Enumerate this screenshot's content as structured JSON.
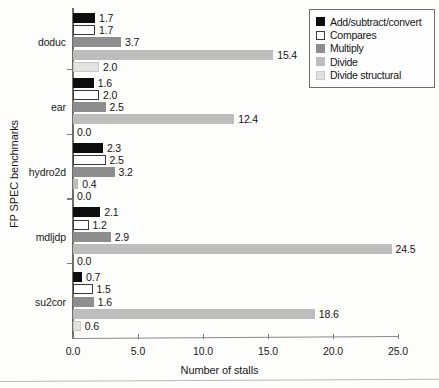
{
  "chart_data": {
    "type": "bar",
    "orientation": "horizontal",
    "title": "",
    "xlabel": "Number of stalls",
    "ylabel": "FP SPEC benchmarks",
    "xlim": [
      0.0,
      25.0
    ],
    "xticks": [
      "0.0",
      "5.0",
      "10.0",
      "15.0",
      "20.0",
      "25.0"
    ],
    "xtick_values": [
      0.0,
      5.0,
      10.0,
      15.0,
      20.0,
      25.0
    ],
    "grid": false,
    "legend_position": "top-right",
    "categories": [
      "doduc",
      "ear",
      "hydro2d",
      "mdljdp",
      "su2cor"
    ],
    "series": [
      {
        "name": "Add/subtract/convert",
        "color": "#0d0d0d",
        "border": "#0d0d0d",
        "values": [
          1.7,
          1.6,
          2.3,
          2.1,
          0.7
        ],
        "labels": [
          "1.7",
          "1.6",
          "2.3",
          "2.1",
          "0.7"
        ]
      },
      {
        "name": "Compares",
        "color": "#ffffff",
        "border": "#3a3a3a",
        "values": [
          1.7,
          2.0,
          2.5,
          1.2,
          1.5
        ],
        "labels": [
          "1.7",
          "2.0",
          "2.5",
          "1.2",
          "1.5"
        ]
      },
      {
        "name": "Multiply",
        "color": "#8e8e8e",
        "border": "#8e8e8e",
        "values": [
          3.7,
          2.5,
          3.2,
          2.9,
          1.6
        ],
        "labels": [
          "3.7",
          "2.5",
          "3.2",
          "2.9",
          "1.6"
        ]
      },
      {
        "name": "Divide",
        "color": "#bdbdbd",
        "border": "#bdbdbd",
        "values": [
          15.4,
          12.4,
          0.4,
          24.5,
          18.6
        ],
        "labels": [
          "15.4",
          "12.4",
          "0.4",
          "24.5",
          "18.6"
        ]
      },
      {
        "name": "Divide structural",
        "color": "#e2e2e2",
        "border": "#c9c9c9",
        "values": [
          2.0,
          0.0,
          0.0,
          0.0,
          0.6
        ],
        "labels": [
          "2.0",
          "0.0",
          "0.0",
          "0.0",
          "0.6"
        ]
      }
    ]
  }
}
